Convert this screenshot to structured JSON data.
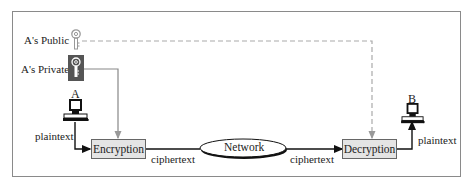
{
  "keys": {
    "public": {
      "label": "A's Public",
      "icon": "key-icon",
      "style": "outline"
    },
    "private": {
      "label": "A's Private",
      "icon": "key-icon",
      "style": "filled-dark"
    }
  },
  "nodes": {
    "sender": {
      "label": "A",
      "icon": "computer-icon"
    },
    "receiver": {
      "label": "B",
      "icon": "computer-icon"
    },
    "encryption": {
      "label": "Encryption"
    },
    "network": {
      "label": "Network"
    },
    "decryption": {
      "label": "Decryption"
    }
  },
  "edges": {
    "sender_plaintext": "plaintext",
    "enc_to_network": "ciphertext",
    "network_to_dec": "ciphertext",
    "receiver_plaintext": "plaintext"
  },
  "colors": {
    "box_fill": "#e4e4e4",
    "frame": "#8a8a8a",
    "key_line": "#888888",
    "private_key_bg": "#555555"
  }
}
